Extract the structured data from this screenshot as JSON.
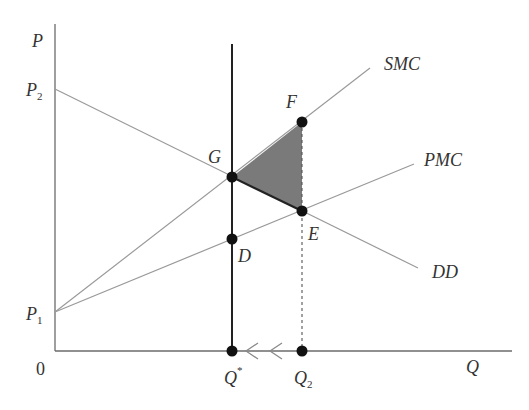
{
  "diagram": {
    "type": "economics-externality-supply-demand",
    "axes": {
      "y_label": "P",
      "x_label": "Q",
      "origin_label": "0"
    },
    "price_levels": [
      {
        "label": "P",
        "sub": "2"
      },
      {
        "label": "P",
        "sub": "1"
      }
    ],
    "quantity_levels": [
      {
        "label": "Q",
        "sup": "*"
      },
      {
        "label": "Q",
        "sub": "2"
      }
    ],
    "curves": [
      {
        "name": "SMC",
        "label": "SMC"
      },
      {
        "name": "PMC",
        "label": "PMC"
      },
      {
        "name": "DD",
        "label": "DD"
      }
    ],
    "points": [
      {
        "name": "F",
        "label": "F"
      },
      {
        "name": "G",
        "label": "G"
      },
      {
        "name": "E",
        "label": "E"
      },
      {
        "name": "D",
        "label": "D"
      }
    ],
    "shaded_region": "triangle GFE (deadweight loss)",
    "colors": {
      "axis": "#6b6b6b",
      "curve": "#9a9a9a",
      "heavy_line": "#222222",
      "point": "#111111",
      "shade": "#7a7a7a"
    }
  }
}
